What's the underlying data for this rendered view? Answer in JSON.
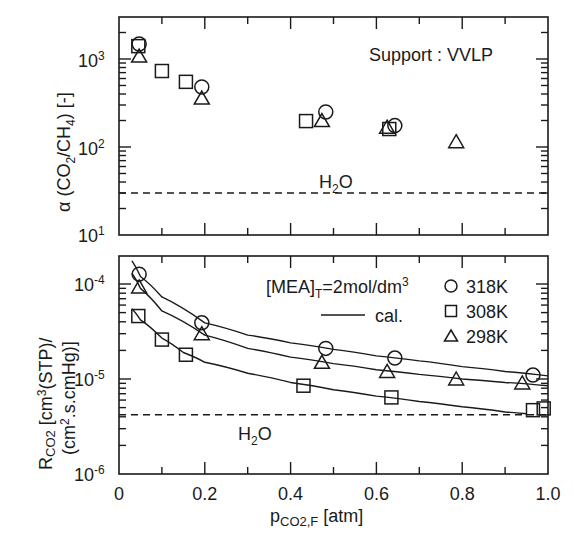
{
  "chart_data": [
    {
      "type": "scatter",
      "panel": "top",
      "title": "",
      "annotation": "Support : VVLP",
      "xlabel": "",
      "ylabel": "α (CO2/CH4) [-]",
      "yscale": "log",
      "xlim": [
        0,
        1.0
      ],
      "ylim": [
        10,
        3000
      ],
      "ytick_labels": [
        "10^1",
        "10^2",
        "10^3"
      ],
      "reference_line": {
        "label": "H2O",
        "y": 30,
        "style": "dashed"
      },
      "series": [
        {
          "name": "318K",
          "marker": "circle",
          "points": [
            [
              0.047,
              1480
            ],
            [
              0.193,
              480
            ],
            [
              0.482,
              250
            ],
            [
              0.643,
              175
            ]
          ]
        },
        {
          "name": "308K",
          "marker": "square",
          "points": [
            [
              0.045,
              1400
            ],
            [
              0.1,
              730
            ],
            [
              0.156,
              550
            ],
            [
              0.436,
              197
            ],
            [
              0.63,
              160
            ]
          ]
        },
        {
          "name": "298K",
          "marker": "triangle",
          "points": [
            [
              0.047,
              1080
            ],
            [
              0.193,
              360
            ],
            [
              0.473,
              200
            ],
            [
              0.625,
              168
            ],
            [
              0.786,
              115
            ]
          ]
        }
      ]
    },
    {
      "type": "scatter",
      "panel": "bottom",
      "title": "",
      "annotation": "[MEA]T=2mol/dm3",
      "xlabel": "pCO2,F [atm]",
      "ylabel": "RCO2 [cm3(STP)/(cm2.s.cmHg)]",
      "yscale": "log",
      "xlim": [
        0,
        1.0
      ],
      "ylim": [
        1e-06,
        0.0002
      ],
      "xtick_labels": [
        "0",
        "0.2",
        "0.4",
        "0.6",
        "0.8",
        "1.0"
      ],
      "ytick_labels": [
        "10^-6",
        "10^-5",
        "10^-4"
      ],
      "legend": [
        "318K",
        "308K",
        "298K",
        "cal."
      ],
      "legend_position": "upper right",
      "reference_line": {
        "label": "H2O",
        "y": 4.2e-06,
        "style": "dashed"
      },
      "series": [
        {
          "name": "318K",
          "marker": "circle",
          "points": [
            [
              0.047,
              0.000127
            ],
            [
              0.193,
              3.9e-05
            ],
            [
              0.482,
              2.1e-05
            ],
            [
              0.643,
              1.66e-05
            ],
            [
              0.965,
              1.1e-05
            ]
          ],
          "fit_curve": [
            [
              0.03,
              0.000175
            ],
            [
              0.05,
              0.00012
            ],
            [
              0.1,
              7.3e-05
            ],
            [
              0.2,
              3.9e-05
            ],
            [
              0.3,
              2.9e-05
            ],
            [
              0.4,
              2.4e-05
            ],
            [
              0.5,
              2.05e-05
            ],
            [
              0.6,
              1.75e-05
            ],
            [
              0.7,
              1.55e-05
            ],
            [
              0.8,
              1.35e-05
            ],
            [
              0.9,
              1.2e-05
            ],
            [
              1.0,
              1.08e-05
            ]
          ]
        },
        {
          "name": "308K",
          "marker": "square",
          "points": [
            [
              0.045,
              4.6e-05
            ],
            [
              0.1,
              2.6e-05
            ],
            [
              0.156,
              1.8e-05
            ],
            [
              0.43,
              8.5e-06
            ],
            [
              0.635,
              6.4e-06
            ],
            [
              0.965,
              4.7e-06
            ],
            [
              0.99,
              4.9e-06
            ]
          ],
          "fit_curve": [
            [
              0.03,
              5.5e-05
            ],
            [
              0.05,
              4.2e-05
            ],
            [
              0.1,
              2.7e-05
            ],
            [
              0.15,
              1.9e-05
            ],
            [
              0.2,
              1.5e-05
            ],
            [
              0.3,
              1.15e-05
            ],
            [
              0.4,
              9.2e-06
            ],
            [
              0.5,
              7.7e-06
            ],
            [
              0.6,
              6.6e-06
            ],
            [
              0.7,
              5.8e-06
            ],
            [
              0.8,
              5.1e-06
            ],
            [
              0.9,
              4.5e-06
            ],
            [
              0.95,
              4.3e-06
            ]
          ]
        },
        {
          "name": "298K",
          "marker": "triangle",
          "points": [
            [
              0.047,
              9.3e-05
            ],
            [
              0.193,
              3e-05
            ],
            [
              0.473,
              1.5e-05
            ],
            [
              0.625,
              1.2e-05
            ],
            [
              0.786,
              1e-05
            ],
            [
              0.94,
              9.1e-06
            ]
          ],
          "fit_curve": [
            [
              0.03,
              0.00013
            ],
            [
              0.05,
              9e-05
            ],
            [
              0.1,
              5.2e-05
            ],
            [
              0.2,
              2.9e-05
            ],
            [
              0.3,
              2.1e-05
            ],
            [
              0.4,
              1.7e-05
            ],
            [
              0.5,
              1.45e-05
            ],
            [
              0.6,
              1.25e-05
            ],
            [
              0.7,
              1.12e-05
            ],
            [
              0.8,
              1e-05
            ],
            [
              0.9,
              9.2e-06
            ],
            [
              1.0,
              8.5e-06
            ]
          ]
        }
      ]
    }
  ],
  "labels": {
    "top_ylabel_main": "α (CO",
    "top_ylabel_sub1": "2",
    "top_ylabel_mid": "/CH",
    "top_ylabel_sub2": "4",
    "top_ylabel_end": ") [-]",
    "support": "Support : VVLP",
    "h2o_main": "H",
    "h2o_sub": "2",
    "h2o_end": "O",
    "mea_main": "[MEA]",
    "mea_sub": "T",
    "mea_mid": "=2mol/dm",
    "mea_sup": "3",
    "cal": "cal.",
    "legend_318": "318K",
    "legend_308": "308K",
    "legend_298": "298K",
    "bottom_ylabel_line1_R": "R",
    "bottom_ylabel_line1_sub": "CO2",
    "bottom_ylabel_line1_rest": " [cm",
    "bottom_ylabel_line1_sup": "3",
    "bottom_ylabel_line1_end": "(STP)/",
    "bottom_ylabel_line2_start": "(cm",
    "bottom_ylabel_line2_sup": "2",
    "bottom_ylabel_line2_end": ".s.cmHg)]",
    "xlabel_p": "p",
    "xlabel_sub": "CO2,F",
    "xlabel_end": " [atm]",
    "ten": "10",
    "top_exp": [
      "1",
      "2",
      "3"
    ],
    "bottom_exp": [
      "-6",
      "-5",
      "-4"
    ],
    "xticks": [
      "0",
      "0.2",
      "0.4",
      "0.6",
      "0.8",
      "1.0"
    ]
  }
}
